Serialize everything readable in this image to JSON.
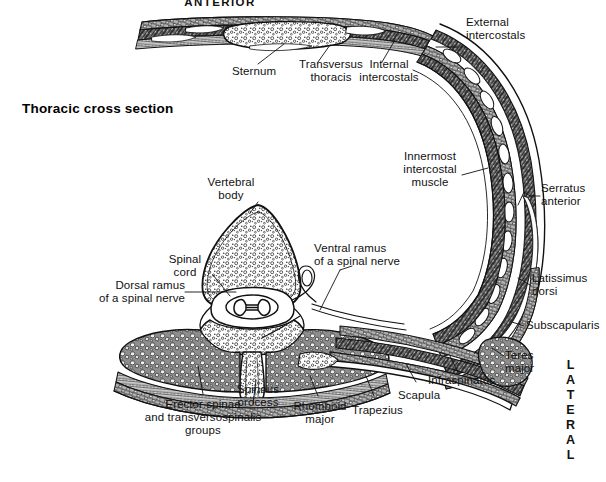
{
  "figure": {
    "title": "Thoracic cross section",
    "orientation_top": "ANTERIOR",
    "orientation_right": "LATERAL",
    "type": "anatomical-cross-section-illustration"
  },
  "labels": {
    "sternum": "Sternum",
    "transversus_thoracis": "Transversus\nthoracis",
    "internal_intercostals": "Internal\nintercostals",
    "external_intercostals": "External\nintercostals",
    "innermost_intercostal_muscle": "Innermost\nintercostal\nmuscle",
    "serratus_anterior": "Serratus\nanterior",
    "latissimus_dorsi": "Latissimus\ndorsi",
    "subscapularis": "Subscapularis",
    "teres_major": "Teres\nmajor",
    "infraspinatus": "Infraspinatus",
    "scapula": "Scapula",
    "trapezius": "Trapezius",
    "rhomboid_major": "Rhomboid\nmajor",
    "spinous_process": "Spinous\nprocess",
    "erector_spinae": "Erector spinae\nand transversospinalis\ngroups",
    "dorsal_ramus": "Dorsal ramus\nof a spinal nerve",
    "ventral_ramus": "Ventral ramus\nof a spinal nerve",
    "spinal_cord": "Spinal\ncord",
    "vertebral_body": "Vertebral\nbody"
  },
  "colors": {
    "ink": "#111111",
    "background": "#ffffff",
    "tissue_light": "#e8e8e8",
    "tissue_mid": "#9a9a9a",
    "tissue_dark": "#3a3a3a",
    "bone_fill": "#ffffff"
  },
  "lateral_letters": [
    "L",
    "A",
    "T",
    "E",
    "R",
    "A",
    "L"
  ]
}
